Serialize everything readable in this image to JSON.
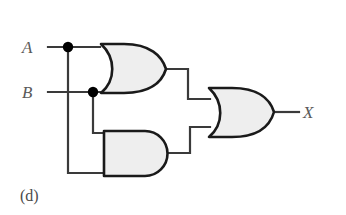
{
  "figure": {
    "panel_label": "(d)",
    "background_color": "#ffffff",
    "wire_color": "#3a3a3a",
    "gate_outline_color": "#1a1a1a",
    "gate_fill_color": "#eeeeee",
    "label_color": "#5a5a5a",
    "junction_dot_color": "#000000"
  },
  "inputs": [
    {
      "name": "input-a",
      "label": "A",
      "x": 22,
      "y": 39
    },
    {
      "name": "input-b",
      "label": "B",
      "x": 22,
      "y": 84
    }
  ],
  "outputs": [
    {
      "name": "output-x",
      "label": "X",
      "x": 303,
      "y": 104
    }
  ],
  "gates": [
    {
      "id": "gate-or-1",
      "type": "OR",
      "label": "OR",
      "inputs": [
        "A",
        "B"
      ],
      "output": "A+B"
    },
    {
      "id": "gate-and-1",
      "type": "AND",
      "label": "AND",
      "inputs": [
        "B",
        "A"
      ],
      "output": "A·B"
    },
    {
      "id": "gate-or-2",
      "type": "OR",
      "label": "OR",
      "inputs": [
        "A+B",
        "A·B"
      ],
      "output": "X"
    }
  ],
  "junctions": [
    {
      "name": "junction-a",
      "x": 68,
      "y": 47
    },
    {
      "name": "junction-b",
      "x": 93,
      "y": 92
    }
  ],
  "expression": "X = (A + B) + (A · B)"
}
